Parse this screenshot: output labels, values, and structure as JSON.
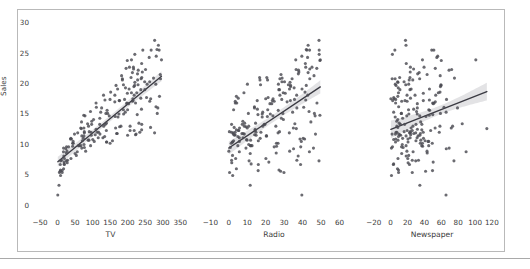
{
  "figure": {
    "background_color": "#ffffff",
    "frame_color": "#b9b9b9",
    "point_color": "#4b4b52",
    "line_color": "#3a3a42",
    "band_color": "#8e8e96",
    "y_axis_label": "Sales",
    "y_ticks": [
      "0",
      "5",
      "10",
      "15",
      "20",
      "25",
      "30"
    ],
    "y_tick_values": [
      0,
      5,
      10,
      15,
      20,
      25,
      30
    ],
    "ylim": [
      -1.2,
      31.0
    ]
  },
  "chart_data": [
    {
      "type": "scatter",
      "title": "",
      "xlabel": "TV",
      "ylabel": "Sales",
      "xlim": [
        -70,
        372
      ],
      "ylim": [
        -1.2,
        31.0
      ],
      "xticks": [
        -50,
        0,
        50,
        100,
        150,
        200,
        250,
        300,
        350
      ],
      "xtick_labels": [
        "−50",
        "0",
        "50",
        "100",
        "150",
        "200",
        "250",
        "300",
        "350"
      ],
      "grid": false,
      "legend": "none",
      "regression": {
        "slope": 0.0475,
        "intercept": 7.0326,
        "ci_half_width_center": 0.48,
        "ci_flare": 1.9,
        "x_data_min": 0.7,
        "x_data_max": 296.4
      },
      "x": [
        230.1,
        44.5,
        17.2,
        151.5,
        180.8,
        8.7,
        57.5,
        120.2,
        8.6,
        199.8,
        66.1,
        214.7,
        23.8,
        97.5,
        204.1,
        195.4,
        67.8,
        281.4,
        69.2,
        147.3,
        218.4,
        237.4,
        13.2,
        228.3,
        62.3,
        262.9,
        142.9,
        240.1,
        248.8,
        70.6,
        292.9,
        112.9,
        97.2,
        265.6,
        95.7,
        290.7,
        266.9,
        74.7,
        43.1,
        228.0,
        202.5,
        177.0,
        293.6,
        206.9,
        25.1,
        175.1,
        89.7,
        239.9,
        227.2,
        66.9,
        199.8,
        100.4,
        216.4,
        182.6,
        262.7,
        198.9,
        7.3,
        136.2,
        210.8,
        210.7,
        53.5,
        261.3,
        239.3,
        102.7,
        131.1,
        69.0,
        31.5,
        139.3,
        237.4,
        216.8,
        199.1,
        109.8,
        26.8,
        129.4,
        213.4,
        16.9,
        27.5,
        120.5,
        5.4,
        116.0,
        76.4,
        239.8,
        75.3,
        68.4,
        213.5,
        193.2,
        76.3,
        110.7,
        88.3,
        109.8,
        134.3,
        28.6,
        217.7,
        250.9,
        107.4,
        163.3,
        197.6,
        184.9,
        289.7,
        135.2,
        222.4,
        296.4,
        280.2,
        187.9,
        238.2,
        137.9,
        25.0,
        90.4,
        13.1,
        255.4,
        225.8,
        241.7,
        175.7,
        209.6,
        78.2,
        75.1,
        139.2,
        76.4,
        125.7,
        19.4,
        141.3,
        18.8,
        224.0,
        123.1,
        229.5,
        87.2,
        7.8,
        80.2,
        220.3,
        59.6,
        0.7,
        265.2,
        8.4,
        219.8,
        36.9,
        48.3,
        25.6,
        273.7,
        43.0,
        184.9,
        73.4,
        193.7,
        220.5,
        104.6,
        96.2,
        140.3,
        240.1,
        243.2,
        38.0,
        44.7,
        280.7,
        121.0,
        197.6,
        171.3,
        187.8,
        4.1,
        93.9,
        149.8,
        11.7,
        131.7,
        172.5,
        85.7,
        188.4,
        163.5,
        117.2,
        234.5,
        17.9,
        206.8,
        215.4,
        284.3,
        50.0,
        164.5,
        19.6,
        168.4,
        222.4,
        276.9,
        248.4,
        170.2,
        276.7,
        165.6,
        156.6,
        218.5,
        56.2,
        287.6,
        253.8,
        205.0,
        139.5,
        191.1,
        286.0,
        18.7,
        39.5,
        75.5,
        17.2,
        166.8,
        149.7,
        38.2,
        94.2,
        177.0,
        283.6,
        232.1
      ],
      "y": [
        22.1,
        10.4,
        9.3,
        18.5,
        12.9,
        7.2,
        11.8,
        13.2,
        4.8,
        15.6,
        12.6,
        17.4,
        9.2,
        13.7,
        19.0,
        22.4,
        12.5,
        24.4,
        11.3,
        14.6,
        18.0,
        17.5,
        5.6,
        20.5,
        9.7,
        17.0,
        15.0,
        20.9,
        18.9,
        10.5,
        21.4,
        11.9,
        13.2,
        17.4,
        11.9,
        17.8,
        25.4,
        14.7,
        10.1,
        21.5,
        16.6,
        17.1,
        20.7,
        12.9,
        8.5,
        14.9,
        10.6,
        23.2,
        14.8,
        9.7,
        11.4,
        10.7,
        22.6,
        21.2,
        20.2,
        23.7,
        5.5,
        13.2,
        23.8,
        18.4,
        8.1,
        24.2,
        15.7,
        14.0,
        18.0,
        9.3,
        9.5,
        13.4,
        18.9,
        22.3,
        18.3,
        12.4,
        8.8,
        11.0,
        17.0,
        8.7,
        6.9,
        14.2,
        5.3,
        11.0,
        11.8,
        12.3,
        11.3,
        13.6,
        21.7,
        15.2,
        12.0,
        16.0,
        12.9,
        16.7,
        11.2,
        7.3,
        19.4,
        22.2,
        11.5,
        16.9,
        16.7,
        20.5,
        25.4,
        17.2,
        16.7,
        23.8,
        19.8,
        19.7,
        20.7,
        15.0,
        7.2,
        12.0,
        5.3,
        19.8,
        18.4,
        21.8,
        17.1,
        20.9,
        14.6,
        12.6,
        12.2,
        9.4,
        15.9,
        6.6,
        15.5,
        7.0,
        11.6,
        15.2,
        19.7,
        10.6,
        6.6,
        8.8,
        24.7,
        9.7,
        1.6,
        12.7,
        5.7,
        19.6,
        10.8,
        11.6,
        9.5,
        20.8,
        9.6,
        20.7,
        10.9,
        19.2,
        20.1,
        10.4,
        11.4,
        10.3,
        13.2,
        25.4,
        10.9,
        10.1,
        16.1,
        11.6,
        16.6,
        19.0,
        15.6,
        3.2,
        15.3,
        10.1,
        7.3,
        12.9,
        14.4,
        13.3,
        14.9,
        18.0,
        11.9,
        11.9,
        8.0,
        12.2,
        17.1,
        15.0,
        8.4,
        14.5,
        7.6,
        11.7,
        11.5,
        27.0,
        20.2,
        11.7,
        11.8,
        12.6,
        10.5,
        12.2,
        8.7,
        26.2,
        17.6,
        22.6,
        10.3,
        17.3,
        15.9,
        6.7,
        10.8,
        9.9,
        5.9,
        19.6,
        17.3,
        7.6,
        9.7,
        12.8,
        25.5,
        13.4
      ]
    },
    {
      "type": "scatter",
      "title": "",
      "xlabel": "Radio",
      "ylabel": "Sales",
      "xlim": [
        -14,
        63
      ],
      "ylim": [
        -1.2,
        31.0
      ],
      "xticks": [
        -10,
        0,
        10,
        20,
        30,
        40,
        50,
        60
      ],
      "xtick_labels": [
        "−10",
        "0",
        "10",
        "20",
        "30",
        "40",
        "50",
        "60"
      ],
      "grid": false,
      "legend": "none",
      "regression": {
        "slope": 0.2025,
        "intercept": 9.3116,
        "ci_half_width_center": 0.62,
        "ci_flare": 2.0,
        "x_data_min": 0.0,
        "x_data_max": 49.6
      },
      "x": [
        37.8,
        39.3,
        45.9,
        41.3,
        10.8,
        48.9,
        32.8,
        19.6,
        2.1,
        2.6,
        5.8,
        24.0,
        35.1,
        7.6,
        32.9,
        47.7,
        36.6,
        39.6,
        20.5,
        23.9,
        27.7,
        5.1,
        15.9,
        16.9,
        12.6,
        3.5,
        29.3,
        16.7,
        27.1,
        16.0,
        28.3,
        17.4,
        1.5,
        20.0,
        1.4,
        4.1,
        43.8,
        49.4,
        26.7,
        37.7,
        22.3,
        33.4,
        27.7,
        8.4,
        25.7,
        22.5,
        9.9,
        41.5,
        15.8,
        11.7,
        3.1,
        9.6,
        41.7,
        46.2,
        28.8,
        49.4,
        28.1,
        19.2,
        49.6,
        29.5,
        2.0,
        42.7,
        15.5,
        29.6,
        42.8,
        9.3,
        24.6,
        14.5,
        27.5,
        43.9,
        30.6,
        14.3,
        33.0,
        5.7,
        24.6,
        43.7,
        1.6,
        28.5,
        29.9,
        7.7,
        26.7,
        4.1,
        20.3,
        44.5,
        43.0,
        18.4,
        27.5,
        40.6,
        25.5,
        47.8,
        4.9,
        1.5,
        33.5,
        36.5,
        14.0,
        31.6,
        3.5,
        21.0,
        42.3,
        41.7,
        4.3,
        36.3,
        10.1,
        17.2,
        34.3,
        46.4,
        11.0,
        0.3,
        0.4,
        26.9,
        8.2,
        38.0,
        15.4,
        20.6,
        46.8,
        35.0,
        14.3,
        0.8,
        36.9,
        16.0,
        26.8,
        21.7,
        2.4,
        34.6,
        32.3,
        11.8,
        38.9,
        0.0,
        49.0,
        12.0,
        39.6,
        2.9,
        27.2,
        33.5,
        38.6,
        47.0,
        39.0,
        28.9,
        25.9,
        43.9,
        17.0,
        35.4,
        33.2,
        5.7,
        14.8,
        1.9,
        7.3,
        49.0,
        40.3,
        25.8,
        13.9,
        8.4,
        23.3,
        39.7,
        21.1,
        11.6,
        43.5,
        1.3,
        36.9,
        18.4,
        18.1,
        35.8,
        18.1,
        36.8,
        14.7,
        3.4,
        37.6,
        5.2,
        23.6,
        10.6,
        11.6,
        20.9,
        20.1,
        7.1,
        3.4,
        48.9,
        30.2,
        7.8,
        2.3,
        10.0,
        2.6,
        5.4,
        5.7,
        43.0,
        21.3,
        45.1,
        2.1,
        28.7,
        13.9,
        12.1,
        41.1,
        10.8,
        4.1,
        42.0,
        35.6,
        3.7,
        4.9,
        9.3,
        42.0,
        8.6
      ],
      "y": [
        22.1,
        10.4,
        9.3,
        18.5,
        12.9,
        7.2,
        11.8,
        13.2,
        4.8,
        15.6,
        12.6,
        17.4,
        9.2,
        13.7,
        19.0,
        22.4,
        12.5,
        24.4,
        11.3,
        14.6,
        18.0,
        17.5,
        5.6,
        20.5,
        9.7,
        17.0,
        15.0,
        20.9,
        18.9,
        10.5,
        21.4,
        11.9,
        13.2,
        17.4,
        11.9,
        17.8,
        25.4,
        14.7,
        10.1,
        21.5,
        16.6,
        17.1,
        20.7,
        12.9,
        8.5,
        14.9,
        10.6,
        23.2,
        14.8,
        9.7,
        11.4,
        10.7,
        22.6,
        21.2,
        20.2,
        23.7,
        5.5,
        13.2,
        23.8,
        18.4,
        8.1,
        24.2,
        15.7,
        14.0,
        18.0,
        9.3,
        9.5,
        13.4,
        18.9,
        22.3,
        18.3,
        12.4,
        8.8,
        11.0,
        17.0,
        8.7,
        6.9,
        14.2,
        5.3,
        11.0,
        11.8,
        12.3,
        11.3,
        13.6,
        21.7,
        15.2,
        12.0,
        16.0,
        12.9,
        16.7,
        11.2,
        7.3,
        19.4,
        22.2,
        11.5,
        16.9,
        16.7,
        20.5,
        25.4,
        17.2,
        16.7,
        23.8,
        19.8,
        19.7,
        20.7,
        15.0,
        7.2,
        12.0,
        5.3,
        19.8,
        18.4,
        21.8,
        17.1,
        20.9,
        14.6,
        12.6,
        12.2,
        9.4,
        15.9,
        6.6,
        15.5,
        7.0,
        11.6,
        15.2,
        19.7,
        10.6,
        6.6,
        8.8,
        24.7,
        9.7,
        1.6,
        12.7,
        5.7,
        19.6,
        10.8,
        11.6,
        9.5,
        20.8,
        9.6,
        20.7,
        10.9,
        19.2,
        20.1,
        10.4,
        11.4,
        10.3,
        13.2,
        25.4,
        10.9,
        10.1,
        16.1,
        11.6,
        16.6,
        19.0,
        15.6,
        3.2,
        15.3,
        10.1,
        7.3,
        12.9,
        14.4,
        13.3,
        14.9,
        18.0,
        11.9,
        11.9,
        8.0,
        12.2,
        17.1,
        15.0,
        8.4,
        14.5,
        7.6,
        11.7,
        11.5,
        27.0,
        20.2,
        11.7,
        11.8,
        12.6,
        10.5,
        12.2,
        8.7,
        26.2,
        17.6,
        22.6,
        10.3,
        17.3,
        15.9,
        6.7,
        10.8,
        9.9,
        5.9,
        19.6,
        17.3,
        7.6,
        9.7,
        12.8,
        25.5,
        13.4
      ]
    },
    {
      "type": "scatter",
      "title": "",
      "xlabel": "Newspaper",
      "ylabel": "Sales",
      "xlim": [
        -28,
        126
      ],
      "ylim": [
        -1.2,
        31.0
      ],
      "xticks": [
        -20,
        0,
        20,
        40,
        60,
        80,
        100,
        120
      ],
      "xtick_labels": [
        "−20",
        "0",
        "20",
        "40",
        "60",
        "80",
        "100",
        "120"
      ],
      "grid": false,
      "legend": "none",
      "regression": {
        "slope": 0.0547,
        "intercept": 12.3514,
        "ci_half_width_center": 0.72,
        "ci_flare": 3.1,
        "x_data_min": 0.3,
        "x_data_max": 114.0
      },
      "x": [
        69.2,
        45.1,
        69.3,
        58.5,
        58.4,
        75.0,
        23.5,
        11.6,
        1.0,
        21.2,
        24.2,
        4.0,
        65.9,
        7.2,
        46.0,
        52.9,
        114.0,
        55.8,
        18.3,
        19.1,
        53.4,
        23.5,
        49.6,
        26.2,
        18.3,
        19.5,
        12.6,
        22.9,
        22.9,
        40.8,
        43.2,
        38.6,
        30.0,
        0.3,
        7.4,
        8.5,
        5.0,
        45.7,
        35.1,
        32.0,
        31.6,
        38.7,
        1.8,
        26.4,
        43.3,
        31.5,
        35.7,
        18.5,
        49.9,
        36.8,
        34.6,
        3.6,
        39.6,
        58.7,
        15.9,
        60.0,
        41.4,
        16.6,
        37.7,
        9.3,
        21.4,
        54.7,
        27.3,
        8.4,
        28.9,
        0.9,
        2.2,
        10.2,
        11.0,
        27.2,
        38.7,
        31.7,
        19.3,
        31.3,
        13.1,
        89.4,
        20.7,
        14.2,
        9.4,
        23.1,
        22.3,
        36.9,
        32.5,
        35.6,
        33.8,
        65.7,
        16.0,
        63.2,
        73.4,
        51.4,
        9.3,
        33.0,
        59.0,
        72.3,
        10.9,
        52.9,
        5.9,
        22.0,
        51.2,
        45.9,
        49.8,
        100.9,
        21.4,
        17.9,
        5.3,
        59.0,
        29.7,
        23.2,
        25.6,
        5.5,
        56.5,
        23.2,
        2.4,
        10.7,
        34.5,
        52.7,
        25.6,
        14.8,
        79.2,
        22.3,
        46.2,
        50.4,
        9.6,
        3.6,
        59.6,
        8.7,
        3.2,
        43.1,
        2.1,
        45.1,
        65.6,
        8.5,
        9.3,
        59.7,
        20.5,
        1.7,
        12.9,
        75.6,
        37.9,
        34.4,
        38.9,
        9.0,
        8.7,
        44.3,
        11.9,
        20.6,
        37.0,
        48.7,
        14.2,
        37.7,
        9.5,
        5.7,
        50.5,
        24.3,
        45.2,
        34.6,
        30.7,
        49.3,
        25.6,
        7.4,
        5.4,
        84.8,
        21.6,
        19.4,
        57.6,
        6.4,
        18.4,
        47.4,
        17.0,
        12.8,
        13.1,
        41.8,
        20.3,
        35.2,
        23.7,
        17.6,
        8.3,
        27.4,
        29.7,
        71.8,
        30.0,
        19.6,
        26.6,
        18.2,
        3.7,
        23.4,
        5.8,
        6.0,
        31.6,
        3.6,
        6.0,
        13.8,
        8.1,
        6.4,
        66.2,
        8.7
      ],
      "y": [
        22.1,
        10.4,
        9.3,
        18.5,
        12.9,
        7.2,
        11.8,
        13.2,
        4.8,
        15.6,
        12.6,
        17.4,
        9.2,
        13.7,
        19.0,
        22.4,
        12.5,
        24.4,
        11.3,
        14.6,
        18.0,
        17.5,
        5.6,
        20.5,
        9.7,
        17.0,
        15.0,
        20.9,
        18.9,
        10.5,
        21.4,
        11.9,
        13.2,
        17.4,
        11.9,
        17.8,
        25.4,
        14.7,
        10.1,
        21.5,
        16.6,
        17.1,
        20.7,
        12.9,
        8.5,
        14.9,
        10.6,
        23.2,
        14.8,
        9.7,
        11.4,
        10.7,
        22.6,
        21.2,
        20.2,
        23.7,
        5.5,
        13.2,
        23.8,
        18.4,
        8.1,
        24.2,
        15.7,
        14.0,
        18.0,
        9.3,
        9.5,
        13.4,
        18.9,
        22.3,
        18.3,
        12.4,
        8.8,
        11.0,
        17.0,
        8.7,
        6.9,
        14.2,
        5.3,
        11.0,
        11.8,
        12.3,
        11.3,
        13.6,
        21.7,
        15.2,
        12.0,
        16.0,
        12.9,
        16.7,
        11.2,
        7.3,
        19.4,
        22.2,
        11.5,
        16.9,
        16.7,
        20.5,
        25.4,
        17.2,
        16.7,
        23.8,
        19.8,
        19.7,
        20.7,
        15.0,
        7.2,
        12.0,
        5.3,
        19.8,
        18.4,
        21.8,
        17.1,
        20.9,
        14.6,
        12.6,
        12.2,
        9.4,
        15.9,
        6.6,
        15.5,
        7.0,
        11.6,
        15.2,
        19.7,
        10.6,
        6.6,
        8.8,
        24.7,
        9.7,
        1.6,
        12.7,
        5.7,
        19.6,
        10.8,
        11.6,
        9.5,
        20.8,
        9.6,
        20.7,
        10.9,
        19.2,
        20.1,
        10.4,
        11.4,
        10.3,
        13.2,
        25.4,
        10.9,
        10.1,
        16.1,
        11.6,
        16.6,
        19.0,
        15.6,
        3.2,
        15.3,
        10.1,
        7.3,
        12.9,
        14.4,
        13.3,
        14.9,
        18.0,
        11.9,
        11.9,
        8.0,
        12.2,
        17.1,
        15.0,
        8.4,
        14.5,
        7.6,
        11.7,
        11.5,
        27.0,
        20.2,
        11.7,
        11.8,
        12.6,
        10.5,
        12.2,
        8.7,
        26.2,
        17.6,
        22.6,
        10.3,
        17.3,
        15.9,
        6.7,
        10.8,
        9.9,
        5.9,
        19.6,
        17.3,
        7.6,
        9.7,
        12.8,
        25.5,
        13.4
      ]
    }
  ],
  "layout": {
    "panels": [
      {
        "left": 33,
        "width": 155
      },
      {
        "left": 203,
        "width": 142
      },
      {
        "left": 367,
        "width": 130
      }
    ]
  }
}
